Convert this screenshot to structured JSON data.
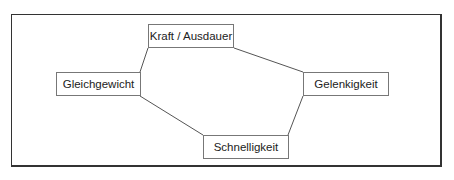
{
  "diagram": {
    "nodes": [
      {
        "id": "kraft",
        "label": "Kraft / Ausdauer"
      },
      {
        "id": "gleich",
        "label": "Gleichgewicht"
      },
      {
        "id": "gelenk",
        "label": "Gelenkigkeit"
      },
      {
        "id": "schnell",
        "label": "Schnelligkeit"
      }
    ],
    "edges": [
      {
        "from": "kraft",
        "to": "gleich"
      },
      {
        "from": "kraft",
        "to": "gelenk"
      },
      {
        "from": "gleich",
        "to": "schnell"
      },
      {
        "from": "schnell",
        "to": "gelenk"
      }
    ],
    "colors": {
      "line": "#555555",
      "frame": "#333333",
      "node_border": "#777777"
    }
  }
}
